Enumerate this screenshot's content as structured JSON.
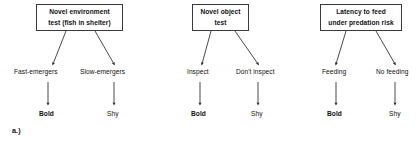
{
  "figure": {
    "caption": "a.)",
    "groups": [
      {
        "id": "novel-environment",
        "test_title_line1": "Novel environment",
        "test_title_line2": "test (fish in shelter)",
        "branches": [
          {
            "behaviour": "Fast-emergers",
            "outcome": "Bold"
          },
          {
            "behaviour": "Slow-emergers",
            "outcome": "Shy"
          }
        ]
      },
      {
        "id": "novel-object",
        "test_title_line1": "Novel object",
        "test_title_line2": "test",
        "branches": [
          {
            "behaviour": "Inspect",
            "outcome": "Bold"
          },
          {
            "behaviour": "Don't inspect",
            "outcome": "Shy"
          }
        ]
      },
      {
        "id": "latency-to-feed",
        "test_title_line1": "Latency to feed",
        "test_title_line2": "under predation risk",
        "branches": [
          {
            "behaviour": "Feeding",
            "outcome": "Bold"
          },
          {
            "behaviour": "No feeding",
            "outcome": "Shy"
          }
        ]
      }
    ]
  },
  "colors": {
    "box_border": "#3a3a3a",
    "arrow": "#2b2b2b",
    "text": "#111111",
    "background": "#ffffff"
  }
}
